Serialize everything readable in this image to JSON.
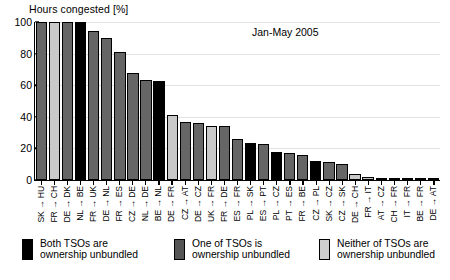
{
  "chart_data": {
    "type": "bar",
    "title": "",
    "annotation": "Jan-May 2005",
    "ylabel": "Hours congested [%]",
    "xlabel": "",
    "ylim": [
      0,
      100
    ],
    "yticks": [
      0,
      20,
      40,
      60,
      80,
      100
    ],
    "grid": true,
    "legend_position": "below",
    "categories": [
      "SK → HU",
      "FR → CH",
      "DE → DK",
      "NL → BE",
      "FR → UK",
      "DE → NL",
      "FR → ES",
      "CZ → DE",
      "NL → DE",
      "BE → NL",
      "DE → FR",
      "CZ → AT",
      "DE → CZ",
      "UK → FR",
      "FR → DE",
      "ES → FR",
      "PL → SK",
      "ES → PT",
      "PL → CZ",
      "PT → ES",
      "FR → BE",
      "CZ → PL",
      "SK → CZ",
      "CZ → SK",
      "DE → CH",
      "FR → IT",
      "AT → CZ",
      "CH → FR",
      "IT → FR",
      "BE → FR",
      "DE → AT"
    ],
    "values": [
      100,
      100,
      100,
      100,
      94,
      90,
      81,
      68,
      63,
      62.5,
      41,
      37,
      36,
      34.5,
      34,
      26,
      23.5,
      22.5,
      18,
      17,
      16,
      12,
      11.5,
      10,
      4,
      2,
      1,
      0.6,
      0.4,
      0.3,
      0.2
    ],
    "groups": [
      "one",
      "neither",
      "one",
      "both",
      "one",
      "one",
      "one",
      "one",
      "one",
      "both",
      "neither",
      "one",
      "one",
      "neither",
      "one",
      "one",
      "both",
      "one",
      "both",
      "one",
      "one",
      "both",
      "one",
      "one",
      "neither",
      "neither",
      "one",
      "one",
      "one",
      "one",
      "one"
    ],
    "group_colors": {
      "both": "#000000",
      "one": "#666666",
      "neither": "#c9c9c9"
    }
  },
  "legend": {
    "items": [
      {
        "key": "both",
        "line1": "Both TSOs are",
        "line2": "ownership unbundled"
      },
      {
        "key": "one",
        "line1": "One of TSOs is",
        "line2": "ownership unbundled"
      },
      {
        "key": "neither",
        "line1": "Neither of TSOs are",
        "line2": "ownership unbundled"
      }
    ]
  }
}
